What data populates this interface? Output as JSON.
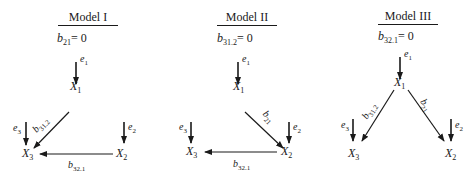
{
  "models": [
    {
      "title": "Model I",
      "constraint": {
        "var": "b",
        "sub": "21",
        "rhs": "= 0"
      },
      "nodes": {
        "x1": {
          "var": "X",
          "sub": "1"
        },
        "x2": {
          "var": "X",
          "sub": "2"
        },
        "x3": {
          "var": "X",
          "sub": "3"
        }
      },
      "errors": {
        "e1": {
          "var": "e",
          "sub": "1"
        },
        "e2": {
          "var": "e",
          "sub": "2"
        },
        "e3": {
          "var": "e",
          "sub": "3"
        }
      },
      "paths": [
        {
          "from": "X1",
          "to": "X3",
          "label": {
            "var": "b",
            "sub": "31.2"
          }
        },
        {
          "from": "X2",
          "to": "X3",
          "label": {
            "var": "b",
            "sub": "32.1"
          }
        }
      ]
    },
    {
      "title": "Model II",
      "constraint": {
        "var": "b",
        "sub": "31.2",
        "rhs": "= 0"
      },
      "nodes": {
        "x1": {
          "var": "X",
          "sub": "1"
        },
        "x2": {
          "var": "X",
          "sub": "2"
        },
        "x3": {
          "var": "X",
          "sub": "3"
        }
      },
      "errors": {
        "e1": {
          "var": "e",
          "sub": "1"
        },
        "e2": {
          "var": "e",
          "sub": "2"
        },
        "e3": {
          "var": "e",
          "sub": "3"
        }
      },
      "paths": [
        {
          "from": "X1",
          "to": "X2",
          "label": {
            "var": "b",
            "sub": "21"
          }
        },
        {
          "from": "X2",
          "to": "X3",
          "label": {
            "var": "b",
            "sub": "32.1"
          }
        }
      ]
    },
    {
      "title": "Model III",
      "constraint": {
        "var": "b",
        "sub": "32.1",
        "rhs": "= 0"
      },
      "nodes": {
        "x1": {
          "var": "X",
          "sub": "1"
        },
        "x2": {
          "var": "X",
          "sub": "2"
        },
        "x3": {
          "var": "X",
          "sub": "3"
        }
      },
      "errors": {
        "e1": {
          "var": "e",
          "sub": "1"
        },
        "e2": {
          "var": "e",
          "sub": "2"
        },
        "e3": {
          "var": "e",
          "sub": "3"
        }
      },
      "paths": [
        {
          "from": "X1",
          "to": "X3",
          "label": {
            "var": "b",
            "sub": "31.2"
          }
        },
        {
          "from": "X1",
          "to": "X2",
          "label": {
            "var": "b",
            "sub": "21"
          }
        }
      ]
    }
  ]
}
